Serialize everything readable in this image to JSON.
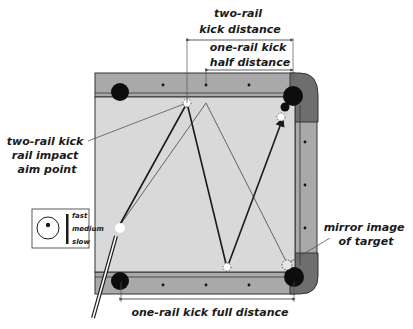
{
  "labels": {
    "two_rail_kick_distance": [
      "two-rail",
      "kick distance"
    ],
    "one_rail_half_distance": [
      "one-rail kick",
      "half distance"
    ],
    "aim_point": [
      "two-rail kick",
      "rail impact",
      "aim point"
    ],
    "mirror_image": [
      "mirror image",
      "of target"
    ],
    "full_distance": "one-rail kick full distance"
  },
  "legend": {
    "speed_levels": [
      "fast",
      "medium",
      "slow"
    ],
    "cue_tip_icon": "cue-ball-center-hit"
  },
  "colors": {
    "cloth": "#d9d9d9",
    "rail": "#a9a9a9",
    "corner_pocket_leather": "#6e6e6e",
    "pocket": "#0d0d0d",
    "line": "#1a1a1a",
    "thin_line": "#555555"
  }
}
